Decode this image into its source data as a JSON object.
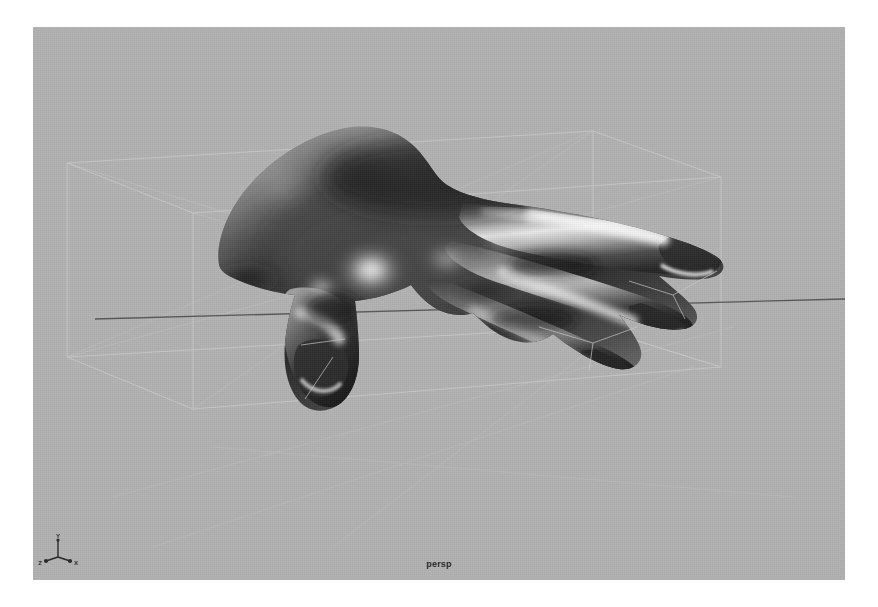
{
  "app": {
    "type": "3d-modeling-viewport",
    "background_color": "#ffffff"
  },
  "viewport": {
    "name": "persp",
    "label": "persp",
    "background_color": "#b1b1b1",
    "renderer": "smooth-shaded",
    "width": 812,
    "height": 553
  },
  "axis_gizmo": {
    "y_label": "Y",
    "z_label": "Z",
    "x_label": "X",
    "color": "#2b2b2b"
  },
  "scene": {
    "object_name": "hand",
    "selected": true,
    "shading": "smooth-shaded-grayscale",
    "wireframe_color": "#c4c4c4",
    "bounding_box_color": "#c8c8c8",
    "axis_line_color": "#4a4a4a",
    "highlight_color": "#ffffff",
    "shadow_color": "#1a1a1a",
    "midtone_color": "#6e6e6e"
  }
}
